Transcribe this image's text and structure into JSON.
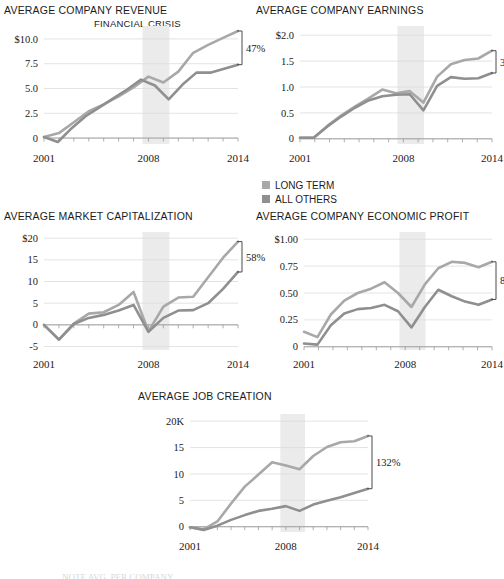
{
  "figure": {
    "crisis_band_label": "FINANCIAL CRISIS",
    "footnote": "NOTE AVG. PER COMPANY",
    "colors": {
      "long_term": "#a8a8a8",
      "all_others": "#8f8f8f",
      "crisis_band": "#ebebeb",
      "gridline": "#dcdcdc",
      "axis": "#9a9a9a",
      "text": "#1a1a1a"
    }
  },
  "legend": {
    "items": [
      {
        "label": "LONG TERM",
        "color": "#a8a8a8"
      },
      {
        "label": "ALL OTHERS",
        "color": "#8f8f8f"
      }
    ]
  },
  "chart_data": [
    {
      "id": "revenue",
      "type": "line",
      "title": "AVERAGE COMPANY REVENUE",
      "xlabel": "",
      "ylabel": "",
      "grid": true,
      "legend_position": "none",
      "annotation": "47%",
      "annotation_note": "Gap between LONG TERM and ALL OTHERS at 2014",
      "crisis_band": [
        2007.6,
        2009.4
      ],
      "x": [
        2001,
        2002,
        2003,
        2004,
        2005,
        2006,
        2007,
        2008,
        2009,
        2010,
        2011,
        2012,
        2013,
        2014
      ],
      "xlim": [
        2001,
        2014
      ],
      "ylim": [
        -0.6,
        10.9
      ],
      "yticks": [
        0,
        2.5,
        5.0,
        7.5,
        10.0
      ],
      "ytick_labels": [
        "0",
        "2.5",
        "5.0",
        "7.5",
        "$10.0"
      ],
      "xticks": [
        2001,
        2008,
        2014
      ],
      "xtick_labels": [
        "2001",
        "2008",
        "2014"
      ],
      "series": [
        {
          "name": "LONG TERM",
          "values": [
            0.1,
            0.5,
            1.6,
            2.7,
            3.4,
            4.2,
            5.1,
            6.2,
            5.6,
            6.7,
            8.6,
            9.4,
            10.1,
            10.8
          ]
        },
        {
          "name": "ALL OTHERS",
          "values": [
            0.1,
            -0.4,
            1.0,
            2.2,
            3.1,
            4.0,
            4.9,
            5.9,
            5.3,
            3.9,
            5.4,
            6.6,
            6.6,
            7.0,
            7.4
          ]
        }
      ]
    },
    {
      "id": "earnings",
      "type": "line",
      "title": "AVERAGE COMPANY EARNINGS",
      "xlabel": "",
      "ylabel": "",
      "grid": true,
      "legend_position": "below",
      "annotation": "36%",
      "annotation_note": "Gap between LONG TERM and ALL OTHERS at 2014",
      "crisis_band": [
        2007.6,
        2009.4
      ],
      "x": [
        2001,
        2002,
        2003,
        2004,
        2005,
        2006,
        2007,
        2008,
        2009,
        2010,
        2011,
        2012,
        2013,
        2014
      ],
      "xlim": [
        2001,
        2014
      ],
      "ylim": [
        -0.1,
        2.1
      ],
      "yticks": [
        0,
        0.5,
        1.0,
        1.5,
        2.0
      ],
      "ytick_labels": [
        "0",
        "0.5",
        "1.0",
        "1.5",
        "$2.0"
      ],
      "xticks": [
        2001,
        2008,
        2014
      ],
      "xtick_labels": [
        "2001",
        "2008",
        "2014"
      ],
      "series": [
        {
          "name": "LONG TERM",
          "values": [
            0.02,
            0.02,
            0.25,
            0.45,
            0.62,
            0.78,
            0.95,
            0.88,
            0.92,
            0.7,
            1.2,
            1.44,
            1.52,
            1.55,
            1.7
          ]
        },
        {
          "name": "ALL OTHERS",
          "values": [
            0.02,
            0.02,
            0.24,
            0.43,
            0.6,
            0.74,
            0.82,
            0.85,
            0.86,
            0.55,
            1.02,
            1.19,
            1.16,
            1.17,
            1.27
          ]
        }
      ]
    },
    {
      "id": "market_cap",
      "type": "line",
      "title": "AVERAGE MARKET CAPITALIZATION",
      "xlabel": "",
      "ylabel": "",
      "grid": true,
      "legend_position": "none",
      "annotation": "58%",
      "annotation_note": "Gap between LONG TERM and ALL OTHERS at 2014",
      "crisis_band": [
        2007.6,
        2009.4
      ],
      "x": [
        2001,
        2002,
        2003,
        2004,
        2005,
        2006,
        2007,
        2008,
        2009,
        2010,
        2011,
        2012,
        2013,
        2014
      ],
      "xlim": [
        2001,
        2014
      ],
      "ylim": [
        -5.8,
        20.5
      ],
      "yticks": [
        -5,
        0,
        5,
        10,
        15,
        20
      ],
      "ytick_labels": [
        "-5",
        "0",
        "5",
        "10",
        "15",
        "$20"
      ],
      "xticks": [
        2001,
        2008,
        2014
      ],
      "xtick_labels": [
        "2001",
        "2008",
        "2014"
      ],
      "series": [
        {
          "name": "LONG TERM",
          "values": [
            0.0,
            -3.4,
            0.3,
            2.6,
            2.9,
            4.6,
            7.6,
            -1.5,
            4.2,
            6.3,
            6.5,
            11.0,
            15.5,
            19.2
          ]
        },
        {
          "name": "ALL OTHERS",
          "values": [
            0.0,
            -3.4,
            0.2,
            1.6,
            2.3,
            3.3,
            4.6,
            -1.6,
            1.6,
            3.3,
            3.4,
            5.0,
            8.3,
            12.2
          ]
        }
      ]
    },
    {
      "id": "economic_profit",
      "type": "line",
      "title": "AVERAGE COMPANY ECONOMIC PROFIT",
      "xlabel": "",
      "ylabel": "",
      "grid": true,
      "legend_position": "none",
      "annotation": "81%",
      "annotation_note": "Gap between LONG TERM and ALL OTHERS at 2014",
      "crisis_band": [
        2007.6,
        2009.4
      ],
      "x": [
        2001,
        2002,
        2003,
        2004,
        2005,
        2006,
        2007,
        2008,
        2009,
        2010,
        2011,
        2012,
        2013,
        2014
      ],
      "xlim": [
        2001,
        2014
      ],
      "ylim": [
        -0.03,
        1.03
      ],
      "yticks": [
        0,
        0.25,
        0.5,
        0.75,
        1.0
      ],
      "ytick_labels": [
        "0",
        "0.25",
        "0.50",
        "0.75",
        "$1.00"
      ],
      "xticks": [
        2001,
        2008,
        2014
      ],
      "xtick_labels": [
        "2001",
        "2008",
        "2014"
      ],
      "series": [
        {
          "name": "LONG TERM",
          "values": [
            0.14,
            0.09,
            0.3,
            0.43,
            0.5,
            0.54,
            0.6,
            0.5,
            0.37,
            0.58,
            0.73,
            0.79,
            0.78,
            0.74,
            0.79
          ]
        },
        {
          "name": "ALL OTHERS",
          "values": [
            0.03,
            0.02,
            0.2,
            0.31,
            0.35,
            0.36,
            0.39,
            0.33,
            0.18,
            0.37,
            0.53,
            0.47,
            0.42,
            0.39,
            0.44
          ]
        }
      ]
    },
    {
      "id": "job_creation",
      "type": "line",
      "title": "AVERAGE JOB CREATION",
      "xlabel": "",
      "ylabel": "",
      "grid": true,
      "legend_position": "none",
      "annotation": "132%",
      "annotation_note": "Gap between LONG TERM and ALL OTHERS at 2014",
      "crisis_band": [
        2007.6,
        2009.4
      ],
      "x": [
        2001,
        2002,
        2003,
        2004,
        2005,
        2006,
        2007,
        2008,
        2009,
        2010,
        2011,
        2012,
        2013,
        2014
      ],
      "xlim": [
        2001,
        2014
      ],
      "ylim": [
        -1.0,
        20.6
      ],
      "yticks": [
        0,
        5,
        10,
        15,
        20
      ],
      "ytick_labels": [
        "0",
        "5",
        "10",
        "15",
        "20K"
      ],
      "xticks": [
        2001,
        2008,
        2014
      ],
      "xtick_labels": [
        "2001",
        "2008",
        "2014"
      ],
      "series": [
        {
          "name": "LONG TERM",
          "values": [
            -0.1,
            -0.5,
            1.0,
            4.4,
            7.6,
            9.9,
            12.2,
            11.6,
            10.9,
            13.4,
            15.1,
            16.0,
            16.2,
            17.2
          ]
        },
        {
          "name": "ALL OTHERS",
          "values": [
            -0.1,
            -0.6,
            0.2,
            1.3,
            2.2,
            3.0,
            3.4,
            3.9,
            3.0,
            4.2,
            4.9,
            5.6,
            6.4,
            7.2
          ]
        }
      ]
    }
  ]
}
